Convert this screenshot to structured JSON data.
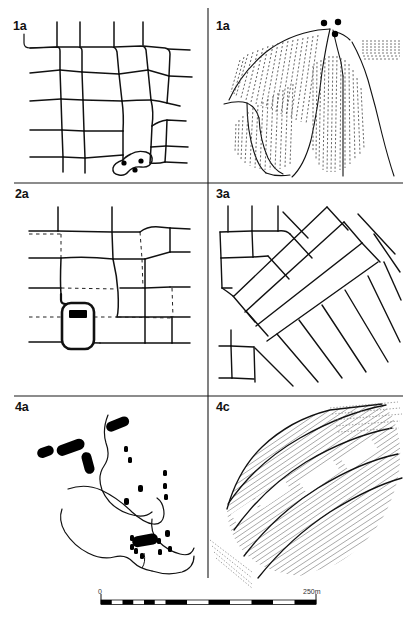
{
  "figure": {
    "kind": "archaeological-plan-figure",
    "background_color": "#ffffff",
    "ink_color": "#000000",
    "panel_count": 6,
    "columns": 2,
    "rows": 3
  },
  "panels": [
    {
      "id": "panel-1",
      "label": "1a",
      "position": "top-left",
      "content": "field-system-plan-with-enclosure-and-three-pits"
    },
    {
      "id": "panel-2",
      "label": "1a",
      "position": "top-right",
      "content": "interpretive-plan-ridge-and-furrow-with-three-pits"
    },
    {
      "id": "panel-3",
      "label": "2a",
      "position": "middle-left",
      "content": "field-system-plan-with-solid-and-dashed-boundaries-and-building"
    },
    {
      "id": "panel-4",
      "label": "3a",
      "position": "middle-right",
      "content": "overlapping-oblique-strip-field-plan"
    },
    {
      "id": "panel-5",
      "label": "4a",
      "position": "bottom-left",
      "content": "contour-plan-with-filled-bar-and-dot-features"
    },
    {
      "id": "panel-6",
      "label": "4c",
      "position": "bottom-right",
      "content": "hachured-ridge-and-furrow-block"
    }
  ],
  "dividers": {
    "vertical_x": 208,
    "horizontal_1_y": 183,
    "horizontal_2_y": 396
  },
  "scale_bar": {
    "start_label": "0",
    "end_label": "250m",
    "units": "m",
    "start_value": 0,
    "end_value": 250,
    "segments": 10,
    "style": "alternating-black-white-checker"
  }
}
